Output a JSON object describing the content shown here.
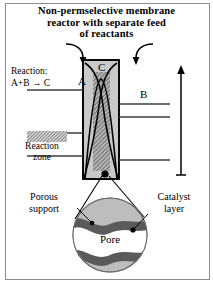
{
  "figure": {
    "title_lines": [
      "Non-permselective membrane",
      "reactor with separate feed",
      "of reactants"
    ],
    "border_color": "#8c8c8c",
    "background": "#ffffff"
  },
  "reaction": {
    "label": "Reaction:",
    "equation": "A+B → C"
  },
  "species": {
    "a_label": "A",
    "b_label": "B",
    "c_label": "C"
  },
  "axis": {
    "concentrations_label": "Concentrations"
  },
  "legend": {
    "reaction_zone_label": "Reaction\nzone",
    "swatch_name": "hatched-swatch"
  },
  "detail": {
    "porous_support_label": "Porous\nsupport",
    "catalyst_layer_label": "Catalyst\nlayer",
    "pore_label": "Pore"
  },
  "colors": {
    "membrane_wall": "#c9c9c9",
    "reaction_zone": "#9a9a9a",
    "catalyst_dark": "#5a5a5a",
    "support_gray": "#bdbdbd",
    "pore_white": "#ffffff",
    "line": "#000000",
    "tick_line": "#3d3d3d"
  },
  "reactor": {
    "inlet_arrow_left_name": "feed-arrow-left",
    "inlet_arrow_right_name": "feed-arrow-right",
    "tick_count_left": 3,
    "tick_count_right": 3
  }
}
